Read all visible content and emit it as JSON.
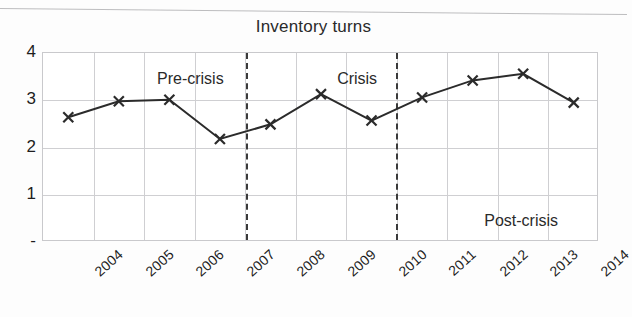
{
  "chart_data": {
    "type": "line",
    "title": "Inventory turns",
    "xlabel": "",
    "ylabel": "",
    "categories": [
      "2004",
      "2005",
      "2006",
      "2007",
      "2008",
      "2009",
      "2010",
      "2011",
      "2012",
      "2013",
      "2014"
    ],
    "series": [
      {
        "name": "Inventory turns",
        "values": [
          2.64,
          2.98,
          3.01,
          2.18,
          2.49,
          3.13,
          2.57,
          3.06,
          3.42,
          3.56,
          2.95
        ]
      }
    ],
    "ylim": [
      0,
      4
    ],
    "yticks": [
      0,
      1,
      2,
      3,
      4
    ],
    "ytick_labels": [
      "-",
      "1",
      "2",
      "3",
      "4"
    ],
    "grid": true,
    "legend": "none",
    "marker": "x",
    "line_color": "#2b2b2b",
    "grid_color": "#cfcfd2",
    "annotations": [
      {
        "text": "Pre-crisis",
        "x_pct": 26.5,
        "y_pct": 9.0
      },
      {
        "text": "Crisis",
        "x_pct": 56.5,
        "y_pct": 9.0
      },
      {
        "text": "Post-crisis",
        "x_pct": 86.0,
        "y_pct": 84.0
      }
    ],
    "dividers": [
      {
        "label": "pre-crisis-to-crisis",
        "x_pct": 36.5
      },
      {
        "label": "crisis-to-post-crisis",
        "x_pct": 63.5
      }
    ]
  }
}
